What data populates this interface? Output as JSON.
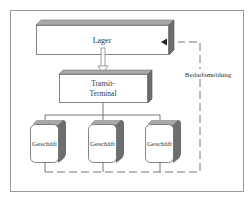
{
  "diagram": {
    "nodes": {
      "warehouse": {
        "label": "Lager"
      },
      "transit": {
        "label_line1": "Transit-",
        "label_line2": "Terminal"
      },
      "stores": [
        {
          "label": "Geschäft"
        },
        {
          "label": "Geschäft"
        },
        {
          "label": "Geschäft"
        }
      ]
    },
    "edges": {
      "feedback_label": "Bedarfsmeldung"
    },
    "colors": {
      "frame": "#9a9a9a",
      "box_top": "#a8a8a8",
      "box_side": "#6e6e6e",
      "line": "#555555"
    }
  }
}
